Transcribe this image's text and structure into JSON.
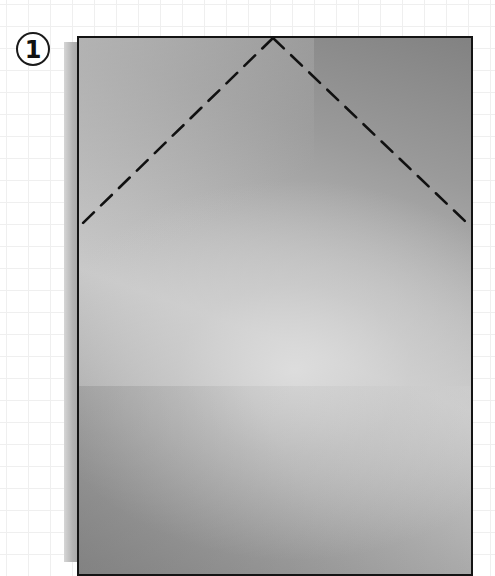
{
  "step": {
    "number": "1"
  },
  "diagram": {
    "type": "origami-fold-step",
    "paper": {
      "shape": "rectangle",
      "border_color": "#141414",
      "fill_colors": [
        "#828282",
        "#b8b8b8",
        "#d0d0d0",
        "#8a8a8a"
      ]
    },
    "fold_lines": [
      {
        "style": "dashed",
        "from": [
          82,
          224
        ],
        "to": [
          273,
          38
        ],
        "label": "left-valley-fold"
      },
      {
        "style": "dashed",
        "from": [
          273,
          38
        ],
        "to": [
          466,
          222
        ],
        "label": "right-valley-fold"
      }
    ],
    "dash_color": "#111111"
  }
}
